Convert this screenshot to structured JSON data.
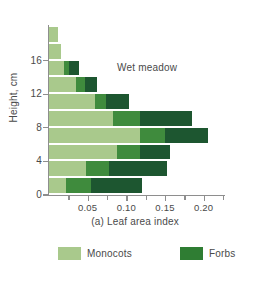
{
  "chart_data": {
    "type": "bar",
    "orientation": "horizontal",
    "stacked": true,
    "title": "Wet meadow",
    "xlabel": "(a) Leaf area index",
    "ylabel": "Height, cm",
    "xlim": [
      0,
      0.225
    ],
    "ylim": [
      0,
      20
    ],
    "grid": false,
    "legend_position": "bottom",
    "xticks_major": [
      0.05,
      0.1,
      0.15,
      0.2
    ],
    "xtick_labels": [
      "0.05",
      "0.10",
      "0.15",
      "0.20"
    ],
    "xticks_minor": [
      0.025,
      0.075,
      0.125,
      0.175,
      0.225
    ],
    "yticks": [
      0,
      4,
      8,
      12,
      16
    ],
    "ytick_labels": [
      "0",
      "4",
      "8",
      "12",
      "16"
    ],
    "categories": [
      "0-2",
      "2-4",
      "4-6",
      "6-8",
      "8-10",
      "10-12",
      "12-14",
      "14-16",
      "16-18",
      "18-20"
    ],
    "series": [
      {
        "name": "Monocots",
        "color": "#a9c98c",
        "values": [
          0.022,
          0.048,
          0.088,
          0.118,
          0.083,
          0.059,
          0.035,
          0.02,
          0.016,
          0.012
        ]
      },
      {
        "name": "Forbs",
        "color": "#3f8b3d",
        "values": [
          0.032,
          0.03,
          0.03,
          0.032,
          0.035,
          0.015,
          0.012,
          0.006,
          0.0,
          0.0
        ]
      },
      {
        "name": "Forbs-dark",
        "color": "#1d5630",
        "values": [
          0.066,
          0.074,
          0.038,
          0.056,
          0.067,
          0.029,
          0.015,
          0.013,
          0.0,
          0.0
        ]
      }
    ],
    "totals": [
      0.12,
      0.152,
      0.156,
      0.206,
      0.185,
      0.103,
      0.062,
      0.039,
      0.016,
      0.012
    ]
  },
  "legend": {
    "entries": [
      {
        "label": "Monocots",
        "color": "#a9c98c"
      },
      {
        "label": "Forbs",
        "color": "#2f7d33"
      }
    ]
  }
}
